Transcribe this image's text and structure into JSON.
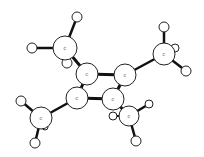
{
  "diagram": {
    "type": "ball-and-stick molecular model",
    "molecule_hint": "tetramethylcyclobutadiene (C8H12)",
    "carbon_label": "C",
    "atoms": [
      {
        "id": "c_me1",
        "el": "C",
        "x": 65,
        "y": 48,
        "r": 12
      },
      {
        "id": "h1a",
        "el": "H",
        "x": 77,
        "y": 17,
        "r": 5
      },
      {
        "id": "h1b",
        "el": "H",
        "x": 32,
        "y": 48,
        "r": 5
      },
      {
        "id": "h1c",
        "el": "H",
        "x": 67,
        "y": 63,
        "r": 5
      },
      {
        "id": "c_r1",
        "el": "C",
        "x": 87,
        "y": 74,
        "r": 11
      },
      {
        "id": "c_r2",
        "el": "C",
        "x": 125,
        "y": 75,
        "r": 11
      },
      {
        "id": "c_r3",
        "el": "C",
        "x": 77,
        "y": 98,
        "r": 11
      },
      {
        "id": "c_r4",
        "el": "C",
        "x": 113,
        "y": 99,
        "r": 11
      },
      {
        "id": "c_me2",
        "el": "C",
        "x": 164,
        "y": 54,
        "r": 11
      },
      {
        "id": "h2a",
        "el": "H",
        "x": 164,
        "y": 27,
        "r": 5
      },
      {
        "id": "h2b",
        "el": "H",
        "x": 175,
        "y": 48,
        "r": 4
      },
      {
        "id": "h2c",
        "el": "H",
        "x": 186,
        "y": 71,
        "r": 5
      },
      {
        "id": "c_me3",
        "el": "C",
        "x": 41,
        "y": 118,
        "r": 11
      },
      {
        "id": "h3a",
        "el": "H",
        "x": 21,
        "y": 101,
        "r": 5
      },
      {
        "id": "h3b",
        "el": "H",
        "x": 35,
        "y": 143,
        "r": 5
      },
      {
        "id": "h3c",
        "el": "H",
        "x": 45,
        "y": 127,
        "r": 3
      },
      {
        "id": "c_me4",
        "el": "C",
        "x": 129,
        "y": 116,
        "r": 10
      },
      {
        "id": "h4a",
        "el": "H",
        "x": 149,
        "y": 104,
        "r": 4
      },
      {
        "id": "h4b",
        "el": "H",
        "x": 113,
        "y": 116,
        "r": 4
      },
      {
        "id": "h4c",
        "el": "H",
        "x": 136,
        "y": 141,
        "r": 5
      }
    ],
    "bonds": [
      {
        "a": "c_r1",
        "b": "c_r2",
        "w": 3
      },
      {
        "a": "c_r1",
        "b": "c_r3",
        "w": 3
      },
      {
        "a": "c_r2",
        "b": "c_r4",
        "w": 3
      },
      {
        "a": "c_r3",
        "b": "c_r4",
        "w": 3
      },
      {
        "a": "c_r1",
        "b": "c_me1",
        "w": 3
      },
      {
        "a": "c_r2",
        "b": "c_me2",
        "w": 2.5
      },
      {
        "a": "c_r3",
        "b": "c_me3",
        "w": 2.5
      },
      {
        "a": "c_r4",
        "b": "c_me4",
        "w": 3
      },
      {
        "a": "c_me1",
        "b": "h1a",
        "w": 2.5
      },
      {
        "a": "c_me1",
        "b": "h1b",
        "w": 2.5
      },
      {
        "a": "c_me1",
        "b": "h1c",
        "w": 2
      },
      {
        "a": "c_me2",
        "b": "h2a",
        "w": 2.5
      },
      {
        "a": "c_me2",
        "b": "h2b",
        "w": 2
      },
      {
        "a": "c_me2",
        "b": "h2c",
        "w": 2.5
      },
      {
        "a": "c_me3",
        "b": "h3a",
        "w": 2.5
      },
      {
        "a": "c_me3",
        "b": "h3b",
        "w": 2.5
      },
      {
        "a": "c_me3",
        "b": "h3c",
        "w": 1.5
      },
      {
        "a": "c_me4",
        "b": "h4a",
        "w": 2.5
      },
      {
        "a": "c_me4",
        "b": "h4b",
        "w": 2
      },
      {
        "a": "c_me4",
        "b": "h4c",
        "w": 2.5
      }
    ]
  }
}
